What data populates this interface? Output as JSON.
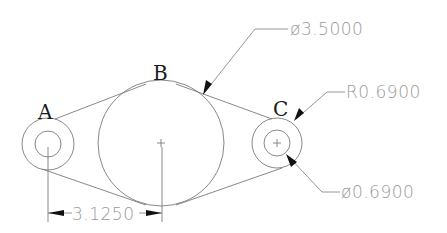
{
  "drawing": {
    "points": [
      {
        "id": "A",
        "label": "A"
      },
      {
        "id": "B",
        "label": "B"
      },
      {
        "id": "C",
        "label": "C"
      }
    ],
    "dimensions": {
      "large_diameter": "ø3.5000",
      "radius_c": "R0.6900",
      "hole_diameter": "ø0.6900",
      "center_distance": "3.1250"
    },
    "colors": {
      "geometry": "#7a7a7a",
      "arrows": "#111111",
      "labels": "#1a1a1a",
      "dimension_text": "#9a9a9a"
    }
  }
}
